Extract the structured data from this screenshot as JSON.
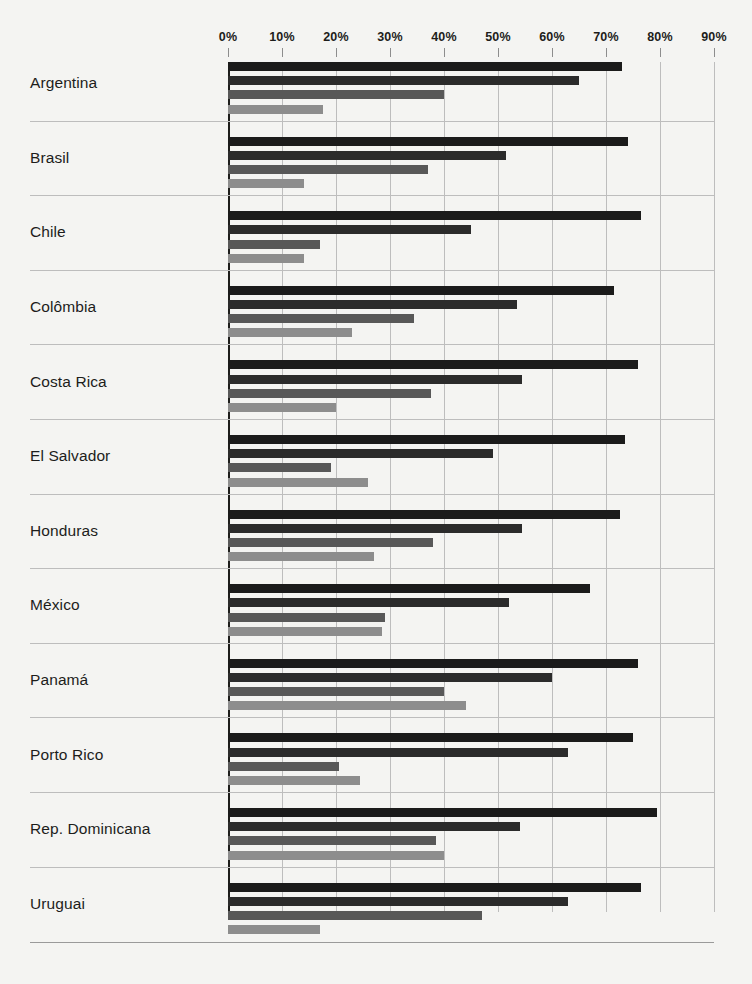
{
  "chart_data": {
    "type": "bar",
    "orientation": "horizontal",
    "title": "",
    "xlabel": "",
    "ylabel": "",
    "xlim": [
      0,
      90
    ],
    "xticks": [
      "0%",
      "10%",
      "20%",
      "30%",
      "40%",
      "50%",
      "60%",
      "70%",
      "80%",
      "90%"
    ],
    "xtick_values": [
      0,
      10,
      20,
      30,
      40,
      50,
      60,
      70,
      80,
      90
    ],
    "grid": "vertical",
    "legend": "none",
    "categories": [
      "Argentina",
      "Brasil",
      "Chile",
      "Colômbia",
      "Costa Rica",
      "El Salvador",
      "Honduras",
      "México",
      "Panamá",
      "Porto Rico",
      "Rep. Dominicana",
      "Uruguai"
    ],
    "series": [
      {
        "name": "serie-1",
        "color": "#1b1b1b",
        "values": [
          73.0,
          74.0,
          76.5,
          71.5,
          76.0,
          73.5,
          72.5,
          67.0,
          76.0,
          75.0,
          79.5,
          76.5
        ]
      },
      {
        "name": "serie-2",
        "color": "#2b2b2b",
        "values": [
          65.0,
          51.5,
          45.0,
          53.5,
          54.5,
          49.0,
          54.5,
          52.0,
          60.0,
          63.0,
          54.0,
          63.0
        ]
      },
      {
        "name": "serie-3",
        "color": "#585858",
        "values": [
          40.0,
          37.0,
          17.0,
          34.5,
          37.5,
          19.0,
          38.0,
          29.0,
          40.0,
          20.5,
          38.5,
          47.0
        ]
      },
      {
        "name": "serie-4",
        "color": "#8d8d8d",
        "values": [
          17.5,
          14.0,
          14.0,
          23.0,
          20.0,
          26.0,
          27.0,
          28.5,
          44.0,
          24.5,
          40.0,
          17.0
        ]
      }
    ]
  },
  "page": {
    "title": "",
    "source": ""
  }
}
